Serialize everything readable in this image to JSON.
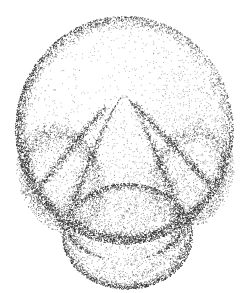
{
  "illustration": {
    "title": "",
    "caption": "",
    "technique": "stipple",
    "medium": "ink-dot-shading",
    "subject": "sectioned-bud-with-central-cone",
    "background_color": "#ffffff",
    "dot_color": "#2b2b2b",
    "canvas": {
      "width": 248,
      "height": 293
    },
    "dot_size_px": 0.85
  },
  "forms": [
    {
      "name": "outer-dome",
      "kind": "sphere",
      "cx": 124,
      "cy": 130,
      "rx": 107,
      "ry": 112,
      "density": 0.16,
      "rim_density": 1.0,
      "light_cx": 96,
      "light_cy": 72,
      "notes": "large outer spherical body, lit from upper-left, dark rim shading along lower-left and right"
    },
    {
      "name": "lower-sphere",
      "kind": "sphere",
      "cx": 127,
      "cy": 236,
      "rx": 64,
      "ry": 52,
      "density": 0.3,
      "rim_density": 1.0,
      "light_cx": 110,
      "light_cy": 214,
      "notes": "lower rounded base partly overlapped by the central cone"
    },
    {
      "name": "central-cone",
      "kind": "teardrop",
      "apex_x": 124,
      "apex_y": 94,
      "base_cy": 222,
      "base_rx": 60,
      "density": 0.22,
      "edge_density": 1.0,
      "notes": "central pointed teardrop / conical body with sharp apex near top-center"
    },
    {
      "name": "left-lobe",
      "kind": "crescent",
      "cx": 62,
      "cy": 178,
      "rx": 44,
      "ry": 58,
      "rotation_deg": -22,
      "density": 0.45,
      "notes": "left lateral fold / petal wall, strongly shaded"
    },
    {
      "name": "right-lobe",
      "kind": "crescent",
      "cx": 190,
      "cy": 176,
      "rx": 42,
      "ry": 56,
      "rotation_deg": 20,
      "density": 0.42,
      "notes": "right lateral fold / petal wall, strongly shaded"
    },
    {
      "name": "left-cleft",
      "kind": "groove",
      "x1": 104,
      "y1": 108,
      "x2": 40,
      "y2": 186,
      "density": 0.9,
      "notes": "dark incision running from apex down-left"
    },
    {
      "name": "right-cleft",
      "kind": "groove",
      "x1": 134,
      "y1": 104,
      "x2": 208,
      "y2": 182,
      "density": 0.9,
      "notes": "dark incision running from apex down-right"
    }
  ],
  "annotations": {
    "labels": [],
    "scale_bar": null,
    "leader_lines": []
  }
}
